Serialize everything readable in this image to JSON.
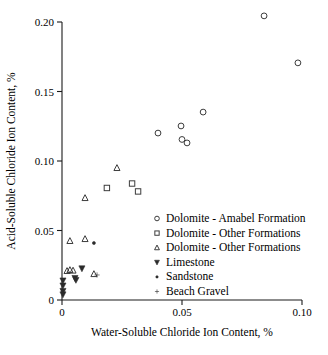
{
  "chart_data": {
    "type": "scatter",
    "title": "",
    "xlabel": "Water-Soluble Chloride Ion Content, %",
    "ylabel": "Acid-Soluble Chloride Ion Content, %",
    "xlim": [
      0,
      0.1
    ],
    "ylim": [
      0,
      0.2
    ],
    "xticks": [
      0,
      0.05,
      0.1
    ],
    "xtick_labels": [
      "0",
      "0.05",
      "0.10"
    ],
    "yticks": [
      0,
      0.05,
      0.1,
      0.15,
      0.2
    ],
    "ytick_labels": [
      "0",
      "0.05",
      "0.10",
      "0.15",
      "0.20"
    ],
    "grid": false,
    "legend_position": "center-right",
    "series": [
      {
        "name": "Dolomite - Amabel Formation",
        "marker": "circle-open",
        "points": [
          [
            0.0842,
            0.2044
          ],
          [
            0.0983,
            0.1706
          ],
          [
            0.0588,
            0.1352
          ],
          [
            0.0496,
            0.1252
          ],
          [
            0.04,
            0.1201
          ],
          [
            0.05,
            0.1155
          ],
          [
            0.0521,
            0.113
          ]
        ]
      },
      {
        "name": "Dolomite - Other Formations",
        "marker": "square-open",
        "points": [
          [
            0.0292,
            0.0838
          ],
          [
            0.0187,
            0.0806
          ],
          [
            0.0317,
            0.0781
          ]
        ]
      },
      {
        "name": "Dolomite - Other Formations",
        "marker": "triangle-up-open",
        "points": [
          [
            0.0229,
            0.095
          ],
          [
            0.0096,
            0.0734
          ],
          [
            0.0096,
            0.0439
          ],
          [
            0.0033,
            0.0425
          ],
          [
            0.0033,
            0.0216
          ],
          [
            0.0046,
            0.0212
          ],
          [
            0.0021,
            0.0209
          ],
          [
            0.0133,
            0.0187
          ]
        ]
      },
      {
        "name": "Limestone",
        "marker": "triangle-down-filled",
        "points": [
          [
            0.0083,
            0.0227
          ],
          [
            0.0054,
            0.0158
          ],
          [
            0.0058,
            0.0144
          ],
          [
            0.0004,
            0.014
          ],
          [
            0.0004,
            0.0104
          ],
          [
            0.0004,
            0.0065
          ],
          [
            0.0004,
            0.004
          ]
        ]
      },
      {
        "name": "Sandstone",
        "marker": "dot-filled",
        "points": [
          [
            0.0133,
            0.041
          ]
        ]
      },
      {
        "name": "Beach Gravel",
        "marker": "plus-filled",
        "points": [
          [
            0.0146,
            0.018
          ]
        ]
      }
    ],
    "legend_entries": [
      {
        "label": "Dolomite - Amabel Formation",
        "marker": "circle-open"
      },
      {
        "label": "Dolomite - Other Formations",
        "marker": "square-open"
      },
      {
        "label": "Dolomite - Other Formations",
        "marker": "triangle-up-open"
      },
      {
        "label": "Limestone",
        "marker": "triangle-down-filled"
      },
      {
        "label": "Sandstone",
        "marker": "dot-filled"
      },
      {
        "label": "Beach Gravel",
        "marker": "plus-filled"
      }
    ],
    "colors": {
      "marker_open_stroke": "#3c3c3c",
      "marker_filled": "#2b2b2b",
      "axis": "#1a1a1a",
      "text": "#000000",
      "background": "#ffffff"
    }
  }
}
